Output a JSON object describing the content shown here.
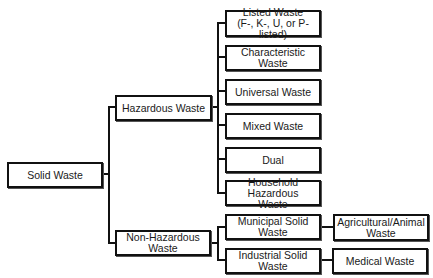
{
  "diagram": {
    "type": "tree",
    "title": "",
    "root": {
      "id": "solid",
      "label": "Solid Waste"
    },
    "level1": [
      {
        "id": "hazardous",
        "label": "Hazardous Waste"
      },
      {
        "id": "nonhazardous",
        "label": "Non-Hazardous\nWaste"
      }
    ],
    "hazardous_children": [
      {
        "id": "listed",
        "label": "Listed Waste\n(F-, K-, U, or P- listed)"
      },
      {
        "id": "characteristic",
        "label": "Characteristic Waste"
      },
      {
        "id": "universal",
        "label": "Universal Waste"
      },
      {
        "id": "mixed",
        "label": "Mixed Waste"
      },
      {
        "id": "dual",
        "label": "Dual"
      },
      {
        "id": "household",
        "label": "Household Hazardous\nWaste"
      }
    ],
    "nonhazardous_children": [
      {
        "id": "municipal",
        "label": "Municipal  Solid\nWaste"
      },
      {
        "id": "industrial",
        "label": "Industrial Solid Waste"
      }
    ],
    "leaf_links": [
      {
        "from": "municipal",
        "id": "agricultural",
        "label": "Agricultural/Animal\nWaste"
      },
      {
        "from": "industrial",
        "id": "medical",
        "label": "Medical Waste"
      }
    ]
  }
}
